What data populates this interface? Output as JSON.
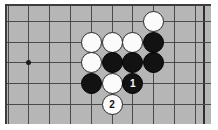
{
  "diagram": {
    "type": "go-board-problem",
    "board": {
      "background_color": "#b6b6b6",
      "frame_color": "#3d3d3d",
      "line_color": "#4a4a4a",
      "columns": 10,
      "rows": 6,
      "cell_size_px": 20.8
    },
    "star_points": [
      {
        "col": 1,
        "row": 3
      }
    ],
    "stones": [
      {
        "col": 7,
        "row": 1,
        "color": "white",
        "label": ""
      },
      {
        "col": 7,
        "row": 2,
        "color": "black",
        "label": ""
      },
      {
        "col": 4,
        "row": 2,
        "color": "white",
        "label": ""
      },
      {
        "col": 5,
        "row": 2,
        "color": "white",
        "label": ""
      },
      {
        "col": 6,
        "row": 2,
        "color": "white",
        "label": ""
      },
      {
        "col": 4,
        "row": 3,
        "color": "white",
        "label": ""
      },
      {
        "col": 5,
        "row": 3,
        "color": "black",
        "label": ""
      },
      {
        "col": 6,
        "row": 3,
        "color": "black",
        "label": ""
      },
      {
        "col": 7,
        "row": 3,
        "color": "black",
        "label": ""
      },
      {
        "col": 4,
        "row": 4,
        "color": "black",
        "label": ""
      },
      {
        "col": 5,
        "row": 4,
        "color": "white",
        "label": ""
      },
      {
        "col": 6,
        "row": 4,
        "color": "black",
        "label": "1"
      },
      {
        "col": 5,
        "row": 5,
        "color": "white",
        "label": "2"
      }
    ]
  }
}
